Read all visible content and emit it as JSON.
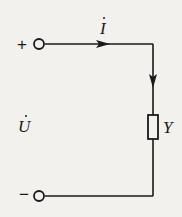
{
  "diagram": {
    "type": "circuit",
    "terminals": {
      "positive": {
        "sign": "+"
      },
      "negative": {
        "sign": "−"
      }
    },
    "current": {
      "symbol": "I",
      "phasor": true,
      "direction": "clockwise"
    },
    "voltage": {
      "symbol": "U",
      "phasor": true
    },
    "element": {
      "symbol": "Y",
      "type": "admittance"
    },
    "colors": {
      "line": "#1a1a1a",
      "background": "#f2f1ee"
    }
  }
}
